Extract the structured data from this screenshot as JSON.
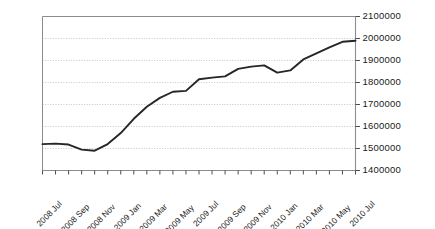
{
  "chart_data": {
    "type": "line",
    "title": "",
    "subtitle": "",
    "xlabel": "",
    "ylabel": "",
    "grid": true,
    "grid_axis": "y",
    "legend": false,
    "legend_position": "none",
    "line_color": "#262626",
    "grid_color": "#b8b8b8",
    "axis_color": "#8c8c8c",
    "background": "#ffffff",
    "ylim": [
      1400000,
      2100000
    ],
    "ytick_values": [
      1400000,
      1500000,
      1600000,
      1700000,
      1800000,
      1900000,
      2000000,
      2100000
    ],
    "ytick_labels": [
      "1400000",
      "1500000",
      "1600000",
      "1700000",
      "1800000",
      "1900000",
      "2000000",
      "2100000"
    ],
    "yaxis_position": "right",
    "x": [
      "2008 Jul",
      "2008 Aug",
      "2008 Sep",
      "2008 Oct",
      "2008 Nov",
      "2008 Dec",
      "2009 Jan",
      "2009 Feb",
      "2009 Mar",
      "2009 Apr",
      "2009 May",
      "2009 Jun",
      "2009 Jul",
      "2009 Aug",
      "2009 Sep",
      "2009 Oct",
      "2009 Nov",
      "2009 Dec",
      "2010 Jan",
      "2010 Feb",
      "2010 Mar",
      "2010 Apr",
      "2010 May",
      "2010 Jun",
      "2010 Jul"
    ],
    "xtick_labels": [
      "2008 Jul",
      "2008 Sep",
      "2008 Nov",
      "2009 Jan",
      "2009 Mar",
      "2009 May",
      "2009 Jul",
      "2009 Sep",
      "2009 Nov",
      "2010 Jan",
      "2010 Mar",
      "2010 May",
      "2010 Jul"
    ],
    "xtick_label_rotation": -45,
    "values": [
      1520000,
      1522000,
      1518000,
      1495000,
      1490000,
      1520000,
      1570000,
      1635000,
      1690000,
      1730000,
      1758000,
      1762000,
      1815000,
      1822000,
      1828000,
      1862000,
      1872000,
      1878000,
      1845000,
      1855000,
      1905000,
      1932000,
      1960000,
      1985000,
      1990000
    ],
    "series": [
      {
        "name": "series-1",
        "color": "#262626",
        "values": [
          1520000,
          1522000,
          1518000,
          1495000,
          1490000,
          1520000,
          1570000,
          1635000,
          1690000,
          1730000,
          1758000,
          1762000,
          1815000,
          1822000,
          1828000,
          1862000,
          1872000,
          1878000,
          1845000,
          1855000,
          1905000,
          1932000,
          1960000,
          1985000,
          1990000
        ]
      }
    ]
  }
}
